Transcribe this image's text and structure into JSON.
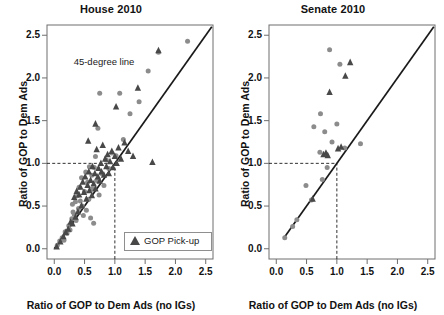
{
  "figure": {
    "background": "#ffffff",
    "circle_color": "#8c8c8c",
    "triangle_color": "#484848",
    "line_color": "#1a1a1a",
    "axis_color": "#6e6e6e"
  },
  "chart_data": [
    {
      "type": "scatter",
      "title": "House 2010",
      "xlabel": "Ratio of GOP to Dem Ads (no IGs)",
      "ylabel": "Ratio of GOP to Dem Ads",
      "xlim": [
        -0.12,
        2.62
      ],
      "ylim": [
        -0.12,
        2.62
      ],
      "xticks": [
        0.0,
        0.5,
        1.0,
        1.5,
        2.0,
        2.5
      ],
      "yticks": [
        0.0,
        0.5,
        1.0,
        1.5,
        2.0,
        2.5
      ],
      "xticklabels": [
        "0.0",
        "0.5",
        "1.0",
        "1.5",
        "2.0",
        "2.5"
      ],
      "yticklabels": [
        "0.0",
        "0.5",
        "1.0",
        "1.5",
        "2.0",
        "2.5"
      ],
      "grid": false,
      "annotations": [
        {
          "text": "45-degree line",
          "x": 0.98,
          "y": 2.18
        }
      ],
      "reference_lines": [
        {
          "name": "45-degree line",
          "type": "diagonal",
          "from": [
            0.0,
            0.0
          ],
          "to": [
            2.6,
            2.6
          ],
          "style": "solid"
        },
        {
          "name": "guide-horizontal-at-1",
          "type": "horizontal",
          "y": 1.0,
          "x_from": -0.12,
          "x_to": 1.0,
          "style": "dashed"
        },
        {
          "name": "guide-vertical-at-1",
          "type": "vertical",
          "x": 1.0,
          "y_from": -0.12,
          "y_to": 1.0,
          "style": "dashed"
        }
      ],
      "legend": {
        "position": "bottom-right",
        "entries": [
          {
            "marker": "triangle",
            "label": "GOP Pick-up"
          }
        ]
      },
      "series": [
        {
          "name": "No GOP Pick-up",
          "marker": "circle",
          "color": "#8c8c8c",
          "points": [
            [
              0.05,
              0.04
            ],
            [
              0.09,
              0.09
            ],
            [
              0.13,
              0.13
            ],
            [
              0.16,
              0.1
            ],
            [
              0.18,
              0.2
            ],
            [
              0.21,
              0.18
            ],
            [
              0.24,
              0.27
            ],
            [
              0.26,
              0.22
            ],
            [
              0.29,
              0.35
            ],
            [
              0.3,
              0.52
            ],
            [
              0.31,
              0.43
            ],
            [
              0.33,
              0.4
            ],
            [
              0.35,
              0.55
            ],
            [
              0.36,
              0.33
            ],
            [
              0.38,
              0.62
            ],
            [
              0.4,
              0.47
            ],
            [
              0.41,
              0.72
            ],
            [
              0.43,
              0.56
            ],
            [
              0.45,
              0.83
            ],
            [
              0.46,
              0.5
            ],
            [
              0.48,
              0.39
            ],
            [
              0.5,
              0.67
            ],
            [
              0.52,
              0.9
            ],
            [
              0.53,
              0.45
            ],
            [
              0.55,
              0.78
            ],
            [
              0.57,
              0.58
            ],
            [
              0.58,
              0.96
            ],
            [
              0.6,
              0.36
            ],
            [
              0.62,
              0.86
            ],
            [
              0.63,
              0.7
            ],
            [
              0.65,
              0.3
            ],
            [
              0.66,
              0.95
            ],
            [
              0.68,
              1.08
            ],
            [
              0.7,
              0.8
            ],
            [
              0.72,
              1.41
            ],
            [
              0.74,
              0.63
            ],
            [
              0.75,
              1.82
            ],
            [
              0.78,
              0.88
            ],
            [
              0.82,
              0.74
            ],
            [
              0.86,
              1.04
            ],
            [
              0.9,
              0.94
            ],
            [
              0.95,
              1.12
            ],
            [
              1.02,
              1.09
            ],
            [
              1.08,
              1.82
            ],
            [
              1.14,
              1.28
            ],
            [
              1.25,
              1.58
            ],
            [
              1.4,
              1.72
            ],
            [
              1.55,
              2.08
            ],
            [
              1.72,
              2.3
            ],
            [
              2.2,
              2.43
            ]
          ]
        },
        {
          "name": "GOP Pick-up",
          "marker": "triangle",
          "color": "#484848",
          "points": [
            [
              0.04,
              0.02
            ],
            [
              0.1,
              0.08
            ],
            [
              0.15,
              0.14
            ],
            [
              0.19,
              0.19
            ],
            [
              0.23,
              0.23
            ],
            [
              0.27,
              0.31
            ],
            [
              0.3,
              0.29
            ],
            [
              0.33,
              0.6
            ],
            [
              0.35,
              0.37
            ],
            [
              0.37,
              0.67
            ],
            [
              0.39,
              0.43
            ],
            [
              0.41,
              0.63
            ],
            [
              0.43,
              0.72
            ],
            [
              0.45,
              0.5
            ],
            [
              0.47,
              0.78
            ],
            [
              0.49,
              0.66
            ],
            [
              0.51,
              0.84
            ],
            [
              0.53,
              0.58
            ],
            [
              0.55,
              0.74
            ],
            [
              0.57,
              0.9
            ],
            [
              0.58,
              0.68
            ],
            [
              0.6,
              0.8
            ],
            [
              0.62,
              0.62
            ],
            [
              0.63,
              0.96
            ],
            [
              0.65,
              0.76
            ],
            [
              0.67,
              0.88
            ],
            [
              0.68,
              0.7
            ],
            [
              0.7,
              1.16
            ],
            [
              0.72,
              0.84
            ],
            [
              0.73,
              0.94
            ],
            [
              0.75,
              0.79
            ],
            [
              0.77,
              1.0
            ],
            [
              0.78,
              0.9
            ],
            [
              0.8,
              1.21
            ],
            [
              0.82,
              0.86
            ],
            [
              0.84,
              1.05
            ],
            [
              0.86,
              0.96
            ],
            [
              0.88,
              1.1
            ],
            [
              0.9,
              0.88
            ],
            [
              0.92,
              1.02
            ],
            [
              0.95,
              1.14
            ],
            [
              0.97,
              0.95
            ],
            [
              1.0,
              1.08
            ],
            [
              1.03,
              1.0
            ],
            [
              1.06,
              1.18
            ],
            [
              1.1,
              1.05
            ],
            [
              1.16,
              1.24
            ],
            [
              1.22,
              1.14
            ],
            [
              1.3,
              1.08
            ],
            [
              1.62,
              1.01
            ],
            [
              0.56,
              1.26
            ],
            [
              0.68,
              1.46
            ],
            [
              1.02,
              1.66
            ],
            [
              1.38,
              1.88
            ],
            [
              1.72,
              2.32
            ]
          ]
        }
      ]
    },
    {
      "type": "scatter",
      "title": "Senate 2010",
      "xlabel": "Ratio of GOP to Dem Ads (no IGs)",
      "ylabel": "Ratio of GOP to Dem Ads",
      "xlim": [
        -0.12,
        2.62
      ],
      "ylim": [
        -0.12,
        2.62
      ],
      "xticks": [
        0.0,
        0.5,
        1.0,
        1.5,
        2.0,
        2.5
      ],
      "yticks": [
        0.0,
        0.5,
        1.0,
        1.5,
        2.0,
        2.5
      ],
      "xticklabels": [
        "0.0",
        "0.5",
        "1.0",
        "1.5",
        "2.0",
        "2.5"
      ],
      "yticklabels": [
        "0.0",
        "0.5",
        "1.0",
        "1.5",
        "2.0",
        "2.5"
      ],
      "grid": false,
      "annotations": [],
      "reference_lines": [
        {
          "name": "45-degree line",
          "type": "diagonal",
          "from": [
            0.12,
            0.12
          ],
          "to": [
            2.6,
            2.6
          ],
          "style": "solid"
        },
        {
          "name": "guide-horizontal-at-1",
          "type": "horizontal",
          "y": 1.0,
          "x_from": -0.12,
          "x_to": 1.0,
          "style": "dashed"
        },
        {
          "name": "guide-vertical-at-1",
          "type": "vertical",
          "x": 1.0,
          "y_from": -0.12,
          "y_to": 1.0,
          "style": "dashed"
        }
      ],
      "legend": null,
      "series": [
        {
          "name": "No GOP Pick-up",
          "marker": "circle",
          "color": "#8c8c8c",
          "points": [
            [
              0.14,
              0.13
            ],
            [
              0.27,
              0.26
            ],
            [
              0.34,
              0.34
            ],
            [
              0.49,
              0.74
            ],
            [
              0.58,
              0.57
            ],
            [
              0.62,
              1.43
            ],
            [
              0.72,
              1.13
            ],
            [
              0.73,
              1.58
            ],
            [
              0.76,
              0.81
            ],
            [
              0.8,
              1.37
            ],
            [
              0.84,
              0.95
            ],
            [
              0.88,
              2.33
            ],
            [
              0.92,
              1.25
            ],
            [
              1.0,
              1.46
            ],
            [
              1.05,
              2.16
            ],
            [
              1.13,
              1.18
            ],
            [
              1.39,
              1.23
            ]
          ]
        },
        {
          "name": "GOP Pick-up",
          "marker": "triangle",
          "color": "#484848",
          "points": [
            [
              0.6,
              0.58
            ],
            [
              0.78,
              1.1
            ],
            [
              0.82,
              1.12
            ],
            [
              0.85,
              1.09
            ],
            [
              0.88,
              1.83
            ],
            [
              1.02,
              1.17
            ],
            [
              1.07,
              1.19
            ],
            [
              1.14,
              2.02
            ],
            [
              1.22,
              2.18
            ]
          ]
        }
      ]
    }
  ]
}
